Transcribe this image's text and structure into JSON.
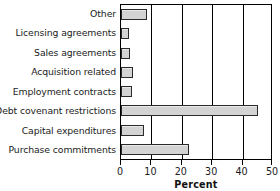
{
  "chart_data": {
    "type": "bar",
    "orientation": "horizontal",
    "title": "",
    "xlabel": "Percent",
    "ylabel": "",
    "xlim": [
      0,
      50
    ],
    "xticks": [
      0,
      10,
      20,
      30,
      40,
      50
    ],
    "xtick_labels": [
      "0",
      "10",
      "20",
      "30",
      "40",
      "50"
    ],
    "grid": "vertical",
    "legend": "none",
    "bar_fill_color": "#d3d3d3",
    "bar_edge_color": "#2a2a2a",
    "axis_color": "#000000",
    "categories": [
      "Other",
      "Licensing agreements",
      "Sales agreements",
      "Acquisition related",
      "Employment contracts",
      "Debt covenant restrictions",
      "Capital expenditures",
      "Purchase commitments"
    ],
    "values": [
      8.5,
      2.5,
      3.0,
      4.0,
      3.5,
      45.0,
      7.5,
      22.5
    ]
  }
}
